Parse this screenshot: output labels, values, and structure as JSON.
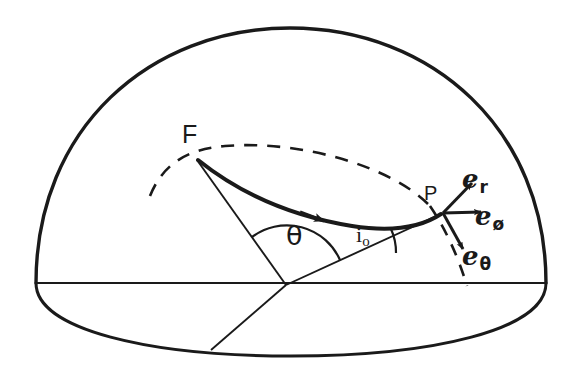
{
  "figure": {
    "type": "diagram",
    "background_color": "#ffffff",
    "ink_color": "#1a1a1a",
    "labels": {
      "focus_point": "F",
      "field_point": "P",
      "central_angle": "θ",
      "inclination_symbol": "i",
      "inclination_subscript": "o",
      "unit_vector_base": "e",
      "unit_vector_radial_subscript": "r",
      "unit_vector_azimuthal_subscript": "ø",
      "unit_vector_polar_subscript": "θ"
    },
    "geometry": {
      "dome_apex": [
        290,
        28
      ],
      "dome_left": [
        36,
        283
      ],
      "dome_right": [
        546,
        283
      ],
      "equator_line_y": 283,
      "center_point": [
        286,
        285
      ],
      "point_F": [
        196,
        158
      ],
      "point_P": [
        443,
        213
      ],
      "bottom_rim_point": [
        211,
        350
      ],
      "bottom_rim_lowest_y": 356
    }
  }
}
